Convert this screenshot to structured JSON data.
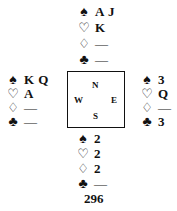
{
  "diagram": {
    "type": "bridge-deal",
    "suit_symbols": {
      "spades": "♠",
      "hearts": "♡",
      "diamonds": "♢",
      "clubs": "♣"
    },
    "hands": {
      "north": {
        "spades": "A J",
        "hearts": "K",
        "diamonds": "—",
        "clubs": "—"
      },
      "west": {
        "spades": "K Q",
        "hearts": "A",
        "diamonds": "—",
        "clubs": "—"
      },
      "east": {
        "spades": "3",
        "hearts": "Q",
        "diamonds": "—",
        "clubs": "3"
      },
      "south": {
        "spades": "2",
        "hearts": "2",
        "diamonds": "2",
        "clubs": "—"
      }
    },
    "compass": {
      "north": "N",
      "south": "S",
      "west": "W",
      "east": "E"
    },
    "page_number": "296"
  }
}
